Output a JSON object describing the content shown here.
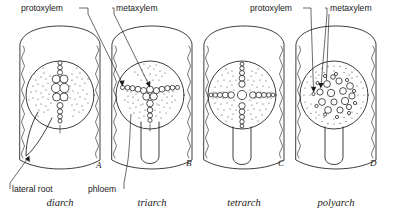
{
  "figure": {
    "background_color": "#ffffff",
    "ink_color": "#1a1a1a"
  },
  "callouts": {
    "protoxylem_1": "protoxylem",
    "metaxylem_1": "metaxylem",
    "protoxylem_2": "protoxylem",
    "metaxylem_2": "metaxylem",
    "lateral_root": "lateral root",
    "phloem": "phloem"
  },
  "panels": [
    {
      "letter": "A",
      "caption": "diarch",
      "arch_count": 2,
      "xylem_arrangement": "vertical-bar",
      "phloem_patches": 2,
      "has_lateral_root": true,
      "lateral_root_side": "left"
    },
    {
      "letter": "B",
      "caption": "triarch",
      "arch_count": 3,
      "xylem_arrangement": "y-shape",
      "phloem_patches": 3,
      "has_lateral_root": true,
      "lateral_root_side": "center"
    },
    {
      "letter": "C",
      "caption": "tetrarch",
      "arch_count": 4,
      "xylem_arrangement": "cross-shape",
      "phloem_patches": 4,
      "has_lateral_root": true,
      "lateral_root_side": "center"
    },
    {
      "letter": "D",
      "caption": "polyarch",
      "arch_count": 12,
      "xylem_arrangement": "scattered-ring",
      "phloem_patches": 12,
      "has_lateral_root": true,
      "lateral_root_side": "center"
    }
  ]
}
